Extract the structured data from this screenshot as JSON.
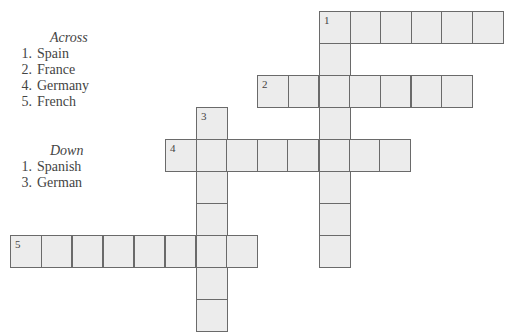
{
  "clues": {
    "across": {
      "heading": "Across",
      "items": [
        {
          "num": "1.",
          "text": "Spain"
        },
        {
          "num": "2.",
          "text": "France"
        },
        {
          "num": "4.",
          "text": "Germany"
        },
        {
          "num": "5.",
          "text": "French"
        }
      ]
    },
    "down": {
      "heading": "Down",
      "items": [
        {
          "num": "1.",
          "text": "Spanish"
        },
        {
          "num": "3.",
          "text": "German"
        }
      ]
    }
  },
  "crossword": {
    "colors": {
      "cell_fill": "#ececec",
      "cell_border": "#6a6a6a"
    },
    "entries": [
      {
        "label": "1",
        "direction": "across",
        "x": 319,
        "y": 11,
        "length": 6,
        "step": 30.6
      },
      {
        "label": "1",
        "direction": "down",
        "x": 319,
        "y": 11,
        "length": 8,
        "step": 32
      },
      {
        "label": "2",
        "direction": "across",
        "x": 257,
        "y": 75,
        "length": 7,
        "step": 30.7
      },
      {
        "label": "3",
        "direction": "down",
        "x": 196,
        "y": 107,
        "length": 7,
        "step": 32
      },
      {
        "label": "4",
        "direction": "across",
        "x": 165,
        "y": 139,
        "length": 8,
        "step": 30.6
      },
      {
        "label": "5",
        "direction": "across",
        "x": 10,
        "y": 235,
        "length": 8,
        "step": 30.9
      }
    ]
  }
}
